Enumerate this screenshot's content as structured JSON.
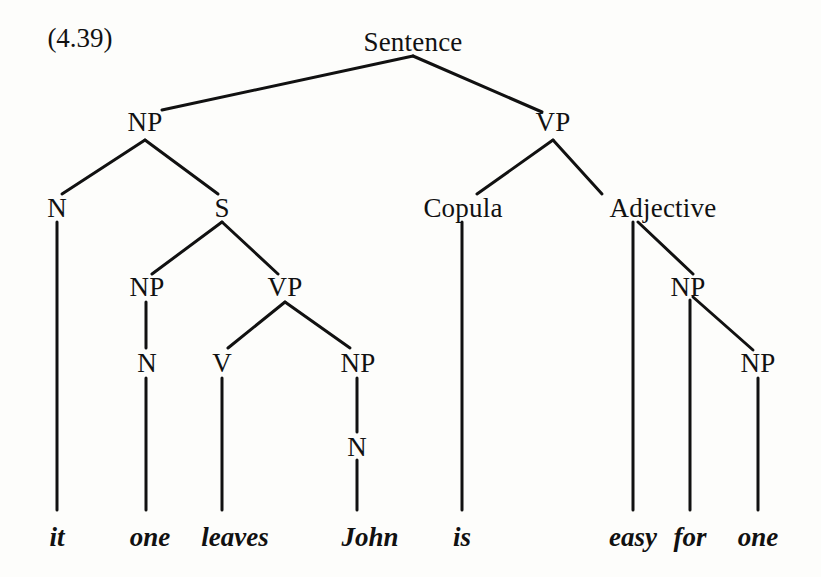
{
  "figure": {
    "example_number": "(4.39)",
    "ink_color": "#111111",
    "page_color": "#fdfdfb"
  },
  "nodes": [
    {
      "id": "sentence",
      "label": "Sentence",
      "x": 413,
      "y": 42
    },
    {
      "id": "np-top",
      "label": "NP",
      "x": 145,
      "y": 122
    },
    {
      "id": "vp-top",
      "label": "VP",
      "x": 553,
      "y": 122
    },
    {
      "id": "n-it",
      "label": "N",
      "x": 57,
      "y": 208
    },
    {
      "id": "s-embed",
      "label": "S",
      "x": 222,
      "y": 208
    },
    {
      "id": "copula",
      "label": "Copula",
      "x": 463,
      "y": 208
    },
    {
      "id": "adjective",
      "label": "Adjective",
      "x": 663,
      "y": 208
    },
    {
      "id": "np-one",
      "label": "NP",
      "x": 147,
      "y": 287
    },
    {
      "id": "vp-embed",
      "label": "VP",
      "x": 285,
      "y": 287
    },
    {
      "id": "np-for",
      "label": "NP",
      "x": 688,
      "y": 287
    },
    {
      "id": "n-one",
      "label": "N",
      "x": 147,
      "y": 363
    },
    {
      "id": "v-leaves",
      "label": "V",
      "x": 222,
      "y": 363
    },
    {
      "id": "np-john",
      "label": "NP",
      "x": 358,
      "y": 363
    },
    {
      "id": "np-oneobj",
      "label": "NP",
      "x": 758,
      "y": 363
    },
    {
      "id": "n-john",
      "label": "N",
      "x": 357,
      "y": 447
    }
  ],
  "leaves": [
    {
      "id": "word-it",
      "text": "it",
      "x": 57,
      "y": 537
    },
    {
      "id": "word-one-1",
      "text": "one",
      "x": 150,
      "y": 537
    },
    {
      "id": "word-leaves",
      "text": "leaves",
      "x": 235,
      "y": 537
    },
    {
      "id": "word-john",
      "text": "John",
      "x": 370,
      "y": 537
    },
    {
      "id": "word-is",
      "text": "is",
      "x": 462,
      "y": 537
    },
    {
      "id": "word-easy",
      "text": "easy",
      "x": 633,
      "y": 537
    },
    {
      "id": "word-for",
      "text": "for",
      "x": 690,
      "y": 537
    },
    {
      "id": "word-one-2",
      "text": "one",
      "x": 758,
      "y": 537
    }
  ],
  "edges": [
    {
      "from": "sentence",
      "to": "np-top",
      "x1": 413,
      "y1": 56,
      "x2": 162,
      "y2": 110
    },
    {
      "from": "sentence",
      "to": "vp-top",
      "x1": 413,
      "y1": 56,
      "x2": 542,
      "y2": 112
    },
    {
      "from": "np-top",
      "to": "n-it",
      "x1": 145,
      "y1": 140,
      "x2": 62,
      "y2": 194
    },
    {
      "from": "np-top",
      "to": "s-embed",
      "x1": 145,
      "y1": 140,
      "x2": 218,
      "y2": 194
    },
    {
      "from": "vp-top",
      "to": "copula",
      "x1": 553,
      "y1": 140,
      "x2": 477,
      "y2": 194
    },
    {
      "from": "vp-top",
      "to": "adjective",
      "x1": 553,
      "y1": 140,
      "x2": 602,
      "y2": 194
    },
    {
      "from": "n-it",
      "to": "word-it",
      "x1": 57,
      "y1": 222,
      "x2": 57,
      "y2": 510
    },
    {
      "from": "s-embed",
      "to": "np-one",
      "x1": 222,
      "y1": 222,
      "x2": 152,
      "y2": 274
    },
    {
      "from": "s-embed",
      "to": "vp-embed",
      "x1": 222,
      "y1": 222,
      "x2": 278,
      "y2": 274
    },
    {
      "from": "copula",
      "to": "word-is",
      "x1": 462,
      "y1": 222,
      "x2": 462,
      "y2": 510
    },
    {
      "from": "adjective",
      "to": "word-easy",
      "x1": 633,
      "y1": 222,
      "x2": 633,
      "y2": 510
    },
    {
      "from": "adjective",
      "to": "np-for",
      "x1": 638,
      "y1": 222,
      "x2": 693,
      "y2": 274
    },
    {
      "from": "np-one",
      "to": "n-one",
      "x1": 146,
      "y1": 302,
      "x2": 146,
      "y2": 348
    },
    {
      "from": "vp-embed",
      "to": "v-leaves",
      "x1": 285,
      "y1": 302,
      "x2": 228,
      "y2": 348
    },
    {
      "from": "vp-embed",
      "to": "np-john",
      "x1": 285,
      "y1": 302,
      "x2": 350,
      "y2": 348
    },
    {
      "from": "np-for",
      "to": "word-for",
      "x1": 690,
      "y1": 300,
      "x2": 690,
      "y2": 510
    },
    {
      "from": "np-for",
      "to": "np-oneobj",
      "x1": 693,
      "y1": 297,
      "x2": 753,
      "y2": 350
    },
    {
      "from": "n-one",
      "to": "word-one-1",
      "x1": 146,
      "y1": 378,
      "x2": 146,
      "y2": 510
    },
    {
      "from": "v-leaves",
      "to": "word-leaves",
      "x1": 222,
      "y1": 378,
      "x2": 222,
      "y2": 510
    },
    {
      "from": "np-john",
      "to": "n-john",
      "x1": 357,
      "y1": 378,
      "x2": 357,
      "y2": 432
    },
    {
      "from": "np-oneobj",
      "to": "word-one-2",
      "x1": 758,
      "y1": 378,
      "x2": 758,
      "y2": 510
    },
    {
      "from": "n-john",
      "to": "word-john",
      "x1": 357,
      "y1": 460,
      "x2": 357,
      "y2": 510
    }
  ],
  "chart_data": {
    "type": "tree",
    "title": "(4.39)",
    "sentence": "it one leaves John is easy for one",
    "root": "Sentence",
    "structure": {
      "label": "Sentence",
      "children": [
        {
          "label": "NP",
          "children": [
            {
              "label": "N",
              "children": [
                {
                  "label": "it",
                  "terminal": true
                }
              ]
            },
            {
              "label": "S",
              "children": [
                {
                  "label": "NP",
                  "children": [
                    {
                      "label": "N",
                      "children": [
                        {
                          "label": "one",
                          "terminal": true
                        }
                      ]
                    }
                  ]
                },
                {
                  "label": "VP",
                  "children": [
                    {
                      "label": "V",
                      "children": [
                        {
                          "label": "leaves",
                          "terminal": true
                        }
                      ]
                    },
                    {
                      "label": "NP",
                      "children": [
                        {
                          "label": "N",
                          "children": [
                            {
                              "label": "John",
                              "terminal": true
                            }
                          ]
                        }
                      ]
                    }
                  ]
                }
              ]
            }
          ]
        },
        {
          "label": "VP",
          "children": [
            {
              "label": "Copula",
              "children": [
                {
                  "label": "is",
                  "terminal": true
                }
              ]
            },
            {
              "label": "Adjective",
              "children": [
                {
                  "label": "easy",
                  "terminal": true
                },
                {
                  "label": "NP",
                  "children": [
                    {
                      "label": "for",
                      "terminal": true
                    },
                    {
                      "label": "NP",
                      "children": [
                        {
                          "label": "one",
                          "terminal": true
                        }
                      ]
                    }
                  ]
                }
              ]
            }
          ]
        }
      ]
    },
    "terminals": [
      "it",
      "one",
      "leaves",
      "John",
      "is",
      "easy",
      "for",
      "one"
    ],
    "nonterminals": [
      "Sentence",
      "NP",
      "VP",
      "N",
      "S",
      "Copula",
      "Adjective",
      "V"
    ]
  }
}
